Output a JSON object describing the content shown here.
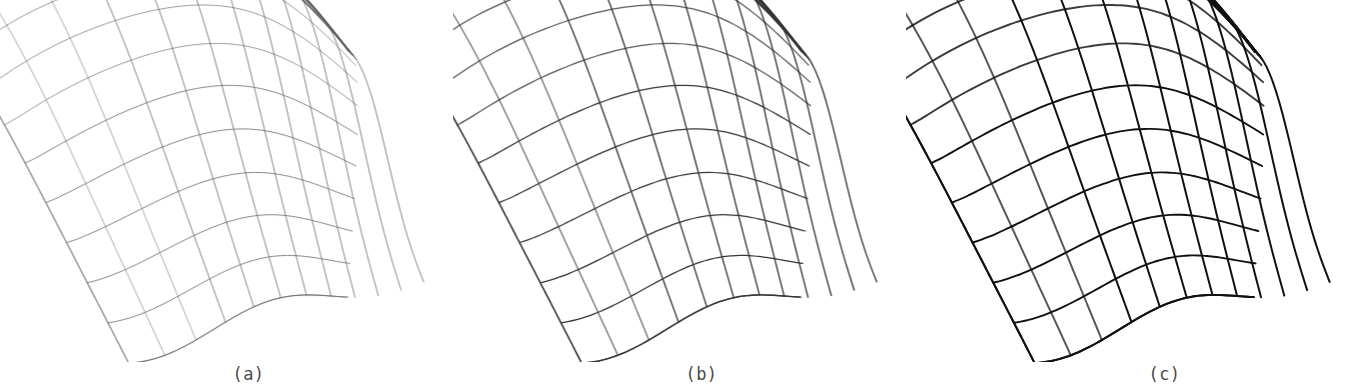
{
  "figure": {
    "background_color": "#ffffff",
    "width": 1359,
    "height": 392,
    "panel_count": 3
  },
  "panels": [
    {
      "id": "a",
      "caption": "(a)",
      "stroke_color": "#4d4d4d",
      "stroke_width": 0.75,
      "ridge_stroke_width": 1.6,
      "opacity": 0.88,
      "origin_x": 0,
      "description": "coarse / lightest wireframe rendering of the saddle surface"
    },
    {
      "id": "b",
      "caption": "(b)",
      "stroke_color": "#2b2b2b",
      "stroke_width": 1.25,
      "ridge_stroke_width": 2.2,
      "opacity": 0.95,
      "origin_x": 453,
      "description": "intermediate weight wireframe rendering of the saddle surface"
    },
    {
      "id": "c",
      "caption": "(c)",
      "stroke_color": "#111111",
      "stroke_width": 1.9,
      "ridge_stroke_width": 3.0,
      "opacity": 1,
      "origin_x": 906,
      "description": "heaviest / darkest wireframe rendering of the saddle surface"
    }
  ],
  "chart_data": {
    "type": "line",
    "subtitle": "",
    "xlabel": "",
    "ylabel": "",
    "grid": false,
    "legend": false,
    "panel_labels": [
      "(a)",
      "(b)",
      "(c)"
    ],
    "surface": {
      "kind": "parametric-wireframe-mesh",
      "u_lines": 11,
      "v_lines": 12,
      "features": [
        "domed ridge along upper edge with dense line convergence",
        "sharp left tip (cusp)",
        "sharp lower tip (cusp)",
        "wavy transverse isolines",
        "short open stubs at right-hand boundary"
      ]
    },
    "landmarks": {
      "left_tip": [
        38,
        188
      ],
      "bottom_tip": [
        102,
        323
      ],
      "ridge_apex": [
        300,
        40
      ],
      "right_edge": [
        448,
        70
      ]
    },
    "series": [
      {
        "name": "panel-a",
        "line_width": 0.75,
        "darkness": 0.3
      },
      {
        "name": "panel-b",
        "line_width": 1.25,
        "darkness": 0.65
      },
      {
        "name": "panel-c",
        "line_width": 1.9,
        "darkness": 1.0
      }
    ]
  }
}
